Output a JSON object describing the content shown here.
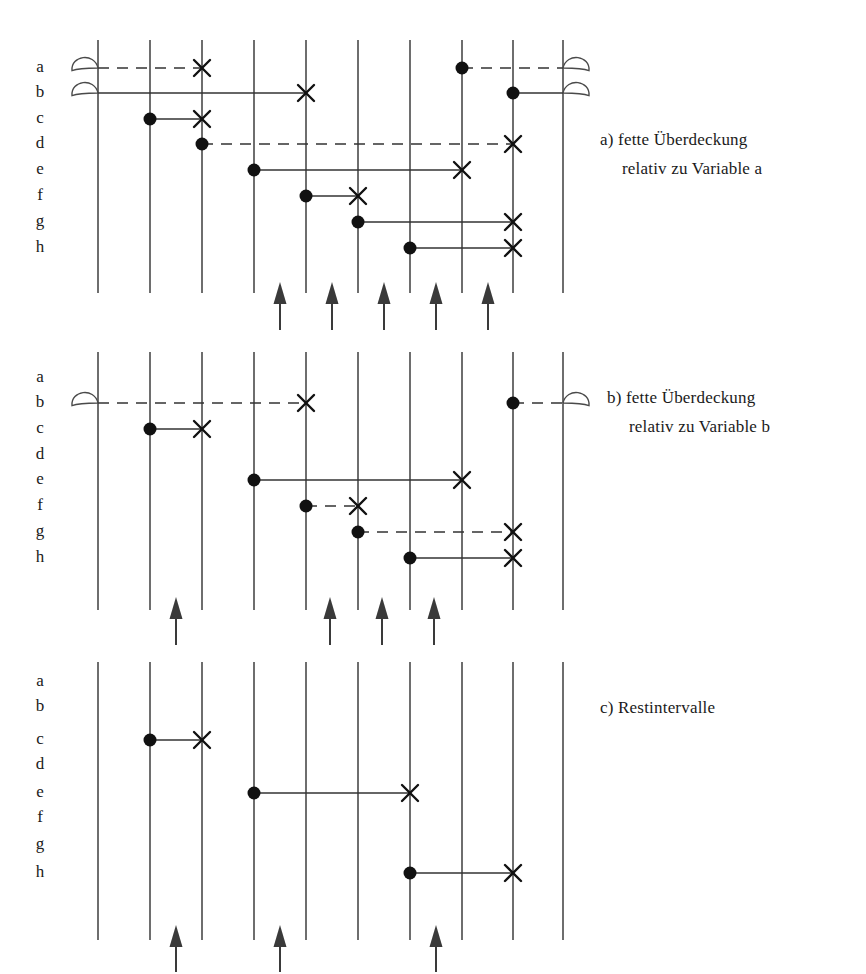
{
  "figure": {
    "title_fragment": "",
    "geometry": {
      "grid_x": [
        98,
        150,
        202,
        254,
        306,
        358,
        410,
        462,
        513,
        563
      ],
      "row_labels": [
        "a",
        "b",
        "c",
        "d",
        "e",
        "f",
        "g",
        "h"
      ],
      "label_x": 40,
      "panels": [
        {
          "id": "panel-a",
          "caption_line1": "a) fette Überdeckung",
          "caption_line2": "relativ zu Variable a",
          "caption_x": 600,
          "caption_y": 130,
          "top": 40,
          "bottom": 293,
          "row_y": [
            68,
            93,
            119,
            144,
            170,
            196,
            222,
            248
          ],
          "intervals": [
            {
              "row": 0,
              "start_line": 0,
              "end_line": 2,
              "style": "dashed",
              "start_marker": "lens",
              "end_marker": "cross"
            },
            {
              "row": 0,
              "start_line": 7,
              "end_line": 9,
              "style": "dashed",
              "start_marker": "dot",
              "end_marker": "lens"
            },
            {
              "row": 1,
              "start_line": 0,
              "end_line": 4,
              "style": "solid",
              "start_marker": "lens",
              "end_marker": "cross"
            },
            {
              "row": 1,
              "start_line": 8,
              "end_line": 9,
              "style": "solid",
              "start_marker": "dot",
              "end_marker": "lens"
            },
            {
              "row": 2,
              "start_line": 1,
              "end_line": 2,
              "style": "solid",
              "start_marker": "dot",
              "end_marker": "cross"
            },
            {
              "row": 3,
              "start_line": 2,
              "end_line": 8,
              "style": "dashed",
              "start_marker": "dot",
              "end_marker": "cross"
            },
            {
              "row": 4,
              "start_line": 3,
              "end_line": 7,
              "style": "solid",
              "start_marker": "dot",
              "end_marker": "cross"
            },
            {
              "row": 5,
              "start_line": 4,
              "end_line": 5,
              "style": "solid",
              "start_marker": "dot",
              "end_marker": "cross"
            },
            {
              "row": 6,
              "start_line": 5,
              "end_line": 8,
              "style": "solid",
              "start_marker": "dot",
              "end_marker": "cross"
            },
            {
              "row": 7,
              "start_line": 6,
              "end_line": 8,
              "style": "solid",
              "start_marker": "dot",
              "end_marker": "cross"
            }
          ],
          "arrows_x": [
            280,
            332,
            384,
            436,
            488
          ],
          "arrow_tip_y": 282,
          "arrow_tail_y": 330
        },
        {
          "id": "panel-b",
          "caption_line1": "b) fette Überdeckung",
          "caption_line2": "relativ zu Variable b",
          "caption_x": 607,
          "caption_y": 388,
          "top": 352,
          "bottom": 610,
          "row_y": [
            378,
            403,
            429,
            455,
            480,
            506,
            532,
            558
          ],
          "intervals": [
            {
              "row": 1,
              "start_line": 0,
              "end_line": 4,
              "style": "dashed",
              "start_marker": "lens",
              "end_marker": "cross"
            },
            {
              "row": 1,
              "start_line": 8,
              "end_line": 9,
              "style": "dashed",
              "start_marker": "dot",
              "end_marker": "lens"
            },
            {
              "row": 2,
              "start_line": 1,
              "end_line": 2,
              "style": "solid",
              "start_marker": "dot",
              "end_marker": "cross"
            },
            {
              "row": 4,
              "start_line": 3,
              "end_line": 7,
              "style": "solid",
              "start_marker": "dot",
              "end_marker": "cross"
            },
            {
              "row": 5,
              "start_line": 4,
              "end_line": 5,
              "style": "dashed",
              "start_marker": "dot",
              "end_marker": "cross"
            },
            {
              "row": 6,
              "start_line": 5,
              "end_line": 8,
              "style": "dashed",
              "start_marker": "dot",
              "end_marker": "cross"
            },
            {
              "row": 7,
              "start_line": 6,
              "end_line": 8,
              "style": "solid",
              "start_marker": "dot",
              "end_marker": "cross"
            }
          ],
          "arrows_x": [
            176,
            330,
            382,
            434
          ],
          "arrow_tip_y": 597,
          "arrow_tail_y": 645
        },
        {
          "id": "panel-c",
          "caption_line1": "c) Restintervalle",
          "caption_line2": "",
          "caption_x": 600,
          "caption_y": 698,
          "top": 662,
          "bottom": 940,
          "row_y": [
            682,
            707,
            740,
            765,
            793,
            818,
            845,
            873
          ],
          "intervals": [
            {
              "row": 2,
              "start_line": 1,
              "end_line": 2,
              "style": "solid",
              "start_marker": "dot",
              "end_marker": "cross"
            },
            {
              "row": 4,
              "start_line": 3,
              "end_line": 6,
              "style": "solid",
              "start_marker": "dot",
              "end_marker": "cross"
            },
            {
              "row": 7,
              "start_line": 6,
              "end_line": 8,
              "style": "solid",
              "start_marker": "dot",
              "end_marker": "cross"
            }
          ],
          "arrows_x": [
            176,
            280,
            436
          ],
          "arrow_tip_y": 925,
          "arrow_tail_y": 972
        }
      ]
    },
    "style": {
      "line_color": "#4a4a4a",
      "marker_color": "#111111",
      "interval_color": "#333333",
      "arrow_color": "#3a3a3a",
      "text_color": "#1a1a1a",
      "grid_line_width": 1.6,
      "interval_line_width": 1.5,
      "dot_radius": 6.5,
      "cross_size": 8,
      "lens_width": 26,
      "lens_height": 26
    }
  }
}
